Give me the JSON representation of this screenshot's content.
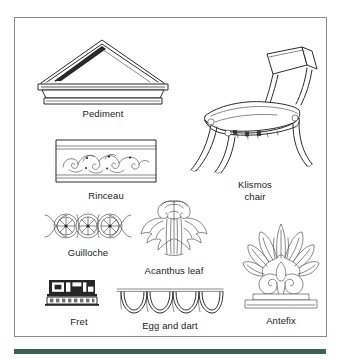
{
  "plate": {
    "title": "Greek Revival architectural and furniture motifs",
    "border_color": "#8a8a8a",
    "background_color": "#ffffff",
    "ink_color": "#2b2b2b",
    "rule_color": "#3a6351"
  },
  "figures": [
    {
      "id": "pediment",
      "label": "Pediment",
      "icon": "pediment-icon",
      "description": "Low triangular gable with layered raking cornice over a horizontal entablature band"
    },
    {
      "id": "rinceau",
      "label": "Rinceau",
      "icon": "rinceau-icon",
      "description": "Horizontal frieze band of scrolling foliate spirals between moulded rails"
    },
    {
      "id": "guilloche",
      "label": "Guilloche",
      "icon": "guilloche-icon",
      "description": "Band of three interlaced ribbon circles each enclosing a rosette"
    },
    {
      "id": "fret",
      "label": "Fret",
      "icon": "fret-icon",
      "description": "Dark Greek key meander band above a narrow patterned strip"
    },
    {
      "id": "egg-and-dart",
      "label": "Egg and dart",
      "icon": "egg-and-dart-icon",
      "description": "Ovolo moulding of four egg forms alternating with pointed darts"
    },
    {
      "id": "acanthus-leaf",
      "label": "Acanthus leaf",
      "icon": "acanthus-leaf-icon",
      "description": "Symmetrical stylised acanthus foliage with lobed serrated leaves"
    },
    {
      "id": "antefix",
      "label": "Antefix",
      "icon": "antefix-icon",
      "description": "Fan palmette rising from paired volute scrolls on a stepped plinth"
    },
    {
      "id": "klismos-chair",
      "label": "Klismos\nchair",
      "icon": "klismos-chair-icon",
      "description": "Side chair with concave curved back rail and splayed sabre legs"
    }
  ]
}
